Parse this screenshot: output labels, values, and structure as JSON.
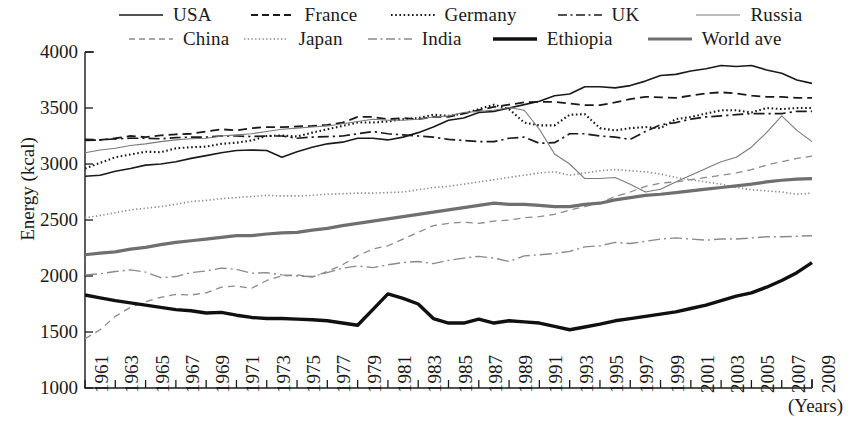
{
  "chart_data": {
    "type": "line",
    "title": "",
    "xlabel": "(Years)",
    "ylabel": "Energy  (kcal)",
    "xlim": [
      1961,
      2009
    ],
    "ylim": [
      1000,
      4000
    ],
    "ytick_labels": [
      "4000",
      "3500",
      "3000",
      "2500",
      "2000",
      "1500",
      "1000"
    ],
    "ytick_values": [
      4000,
      3500,
      3000,
      2500,
      2000,
      1500,
      1000
    ],
    "xtick_labels": [
      "1961",
      "1963",
      "1965",
      "1967",
      "1969",
      "1971",
      "1973",
      "1975",
      "1977",
      "1979",
      "1981",
      "1983",
      "1985",
      "1987",
      "1989",
      "1991",
      "1993",
      "1995",
      "1997",
      "1999",
      "2001",
      "2003",
      "2005",
      "2007",
      "2009"
    ],
    "xtick_values": [
      1961,
      1963,
      1965,
      1967,
      1969,
      1971,
      1973,
      1975,
      1977,
      1979,
      1981,
      1983,
      1985,
      1987,
      1989,
      1991,
      1993,
      1995,
      1997,
      1999,
      2001,
      2003,
      2005,
      2007,
      2009
    ],
    "x": [
      1961,
      1962,
      1963,
      1964,
      1965,
      1966,
      1967,
      1968,
      1969,
      1970,
      1971,
      1972,
      1973,
      1974,
      1975,
      1976,
      1977,
      1978,
      1979,
      1980,
      1981,
      1982,
      1983,
      1984,
      1985,
      1986,
      1987,
      1988,
      1989,
      1990,
      1991,
      1992,
      1993,
      1994,
      1995,
      1996,
      1997,
      1998,
      1999,
      2000,
      2001,
      2002,
      2003,
      2004,
      2005,
      2006,
      2007,
      2008,
      2009
    ],
    "grid": false,
    "legend_position": "top",
    "series": [
      {
        "name": "USA",
        "style": "solid",
        "color": "#1a1a1a",
        "width": 1.6,
        "values": [
          2890,
          2900,
          2935,
          2960,
          2990,
          3000,
          3020,
          3050,
          3075,
          3100,
          3120,
          3125,
          3120,
          3060,
          3110,
          3150,
          3180,
          3195,
          3230,
          3230,
          3215,
          3240,
          3280,
          3330,
          3390,
          3410,
          3460,
          3470,
          3500,
          3530,
          3560,
          3610,
          3625,
          3690,
          3690,
          3680,
          3700,
          3740,
          3790,
          3800,
          3830,
          3850,
          3880,
          3870,
          3880,
          3840,
          3810,
          3750,
          3720
        ]
      },
      {
        "name": "France",
        "style": "dashed",
        "color": "#1a1a1a",
        "width": 1.8,
        "values": [
          3220,
          3215,
          3230,
          3250,
          3240,
          3255,
          3265,
          3270,
          3290,
          3310,
          3300,
          3320,
          3330,
          3330,
          3335,
          3340,
          3350,
          3370,
          3420,
          3420,
          3400,
          3410,
          3400,
          3420,
          3420,
          3450,
          3480,
          3510,
          3530,
          3550,
          3555,
          3555,
          3540,
          3525,
          3525,
          3550,
          3580,
          3600,
          3595,
          3590,
          3610,
          3630,
          3640,
          3630,
          3610,
          3600,
          3600,
          3590,
          3590
        ]
      },
      {
        "name": "Germany",
        "style": "dotted",
        "color": "#1a1a1a",
        "width": 2.1,
        "values": [
          2960,
          3010,
          3060,
          3085,
          3110,
          3105,
          3140,
          3150,
          3155,
          3180,
          3190,
          3210,
          3250,
          3255,
          3245,
          3280,
          3310,
          3340,
          3370,
          3370,
          3380,
          3400,
          3410,
          3440,
          3430,
          3450,
          3490,
          3530,
          3490,
          3370,
          3345,
          3345,
          3440,
          3445,
          3320,
          3300,
          3320,
          3330,
          3320,
          3400,
          3420,
          3450,
          3480,
          3480,
          3460,
          3500,
          3490,
          3500,
          3500
        ]
      },
      {
        "name": "UK",
        "style": "dashdot",
        "color": "#1a1a1a",
        "width": 1.7,
        "values": [
          3210,
          3215,
          3225,
          3230,
          3230,
          3225,
          3235,
          3240,
          3240,
          3250,
          3250,
          3245,
          3250,
          3250,
          3230,
          3240,
          3245,
          3250,
          3270,
          3290,
          3270,
          3260,
          3250,
          3240,
          3220,
          3210,
          3200,
          3200,
          3230,
          3240,
          3185,
          3190,
          3270,
          3270,
          3250,
          3240,
          3220,
          3290,
          3350,
          3370,
          3400,
          3420,
          3430,
          3440,
          3450,
          3450,
          3450,
          3470,
          3470
        ]
      },
      {
        "name": "Russia",
        "style": "solid-thin-gray",
        "color": "#7a7a7a",
        "width": 1.1,
        "values": [
          3100,
          3125,
          3140,
          3165,
          3180,
          3200,
          3215,
          3225,
          3230,
          3250,
          3260,
          3270,
          3290,
          3310,
          3320,
          3330,
          3340,
          3360,
          3380,
          3400,
          3390,
          3390,
          3400,
          3420,
          3430,
          3460,
          3470,
          3480,
          3505,
          3480,
          3310,
          3090,
          3000,
          2870,
          2870,
          2880,
          2820,
          2750,
          2775,
          2840,
          2900,
          2960,
          3020,
          3060,
          3150,
          3280,
          3430,
          3300,
          3200
        ]
      },
      {
        "name": "China",
        "style": "loose-dashed-gray",
        "color": "#8a8a8a",
        "width": 1.3,
        "values": [
          1440,
          1520,
          1640,
          1720,
          1770,
          1810,
          1835,
          1830,
          1850,
          1900,
          1910,
          1890,
          1960,
          2000,
          2010,
          1990,
          2040,
          2100,
          2180,
          2240,
          2270,
          2330,
          2390,
          2450,
          2470,
          2480,
          2470,
          2490,
          2500,
          2520,
          2530,
          2550,
          2590,
          2620,
          2650,
          2710,
          2750,
          2800,
          2830,
          2840,
          2860,
          2880,
          2900,
          2920,
          2950,
          2990,
          3020,
          3050,
          3070
        ]
      },
      {
        "name": "Japan",
        "style": "fine-dotted-gray",
        "color": "#8a8a8a",
        "width": 1.6,
        "values": [
          2520,
          2540,
          2565,
          2590,
          2605,
          2620,
          2640,
          2665,
          2675,
          2690,
          2700,
          2710,
          2720,
          2715,
          2715,
          2720,
          2730,
          2735,
          2740,
          2740,
          2745,
          2750,
          2770,
          2790,
          2800,
          2820,
          2840,
          2860,
          2880,
          2900,
          2920,
          2930,
          2900,
          2920,
          2940,
          2950,
          2940,
          2930,
          2910,
          2880,
          2860,
          2840,
          2820,
          2790,
          2770,
          2760,
          2750,
          2730,
          2740
        ]
      },
      {
        "name": "India",
        "style": "long-dashdot-gray",
        "color": "#8a8a8a",
        "width": 1.4,
        "values": [
          2010,
          2020,
          2040,
          2055,
          2035,
          1985,
          1995,
          2030,
          2045,
          2070,
          2060,
          2025,
          2030,
          2010,
          2000,
          1995,
          2030,
          2070,
          2090,
          2075,
          2100,
          2120,
          2130,
          2110,
          2140,
          2160,
          2175,
          2160,
          2130,
          2180,
          2190,
          2200,
          2220,
          2260,
          2270,
          2300,
          2290,
          2310,
          2330,
          2340,
          2330,
          2320,
          2330,
          2330,
          2340,
          2350,
          2350,
          2355,
          2360
        ]
      },
      {
        "name": "Ethiopia",
        "style": "solid-bold",
        "color": "#101010",
        "width": 3.4,
        "values": [
          1830,
          1805,
          1780,
          1760,
          1740,
          1720,
          1700,
          1690,
          1670,
          1675,
          1650,
          1630,
          1620,
          1620,
          1615,
          1610,
          1600,
          1580,
          1560,
          1700,
          1840,
          1800,
          1750,
          1620,
          1580,
          1580,
          1615,
          1580,
          1600,
          1590,
          1580,
          1550,
          1520,
          1545,
          1570,
          1600,
          1620,
          1640,
          1660,
          1680,
          1710,
          1740,
          1780,
          1820,
          1850,
          1900,
          1960,
          2030,
          2120
        ]
      },
      {
        "name": "World ave",
        "style": "solid-thick-gray",
        "color": "#6f6f6f",
        "width": 3.2,
        "values": [
          2190,
          2205,
          2215,
          2240,
          2255,
          2280,
          2300,
          2315,
          2330,
          2345,
          2360,
          2360,
          2375,
          2385,
          2390,
          2410,
          2425,
          2450,
          2470,
          2490,
          2510,
          2530,
          2550,
          2570,
          2590,
          2610,
          2630,
          2650,
          2640,
          2640,
          2630,
          2620,
          2620,
          2640,
          2650,
          2680,
          2700,
          2720,
          2730,
          2745,
          2760,
          2775,
          2790,
          2805,
          2820,
          2840,
          2855,
          2865,
          2870
        ]
      }
    ],
    "legend_rows": [
      [
        "USA",
        "France",
        "Germany",
        "UK",
        "Russia"
      ],
      [
        "China",
        "Japan",
        "India",
        "Ethiopia",
        "World ave"
      ]
    ]
  }
}
